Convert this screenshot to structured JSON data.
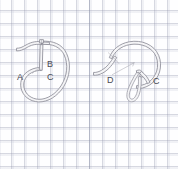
{
  "figure": {
    "type": "stitch-diagram",
    "background": "graph-paper",
    "grid": {
      "cell_px": 13,
      "line_color": "#9a9fb0",
      "paper_color": "#fdfdfd"
    },
    "thread": {
      "stroke_color": "#8a8a92",
      "fill_color": "#f2f2f4",
      "style": "double-outline"
    },
    "panels": [
      {
        "id": "panel-left",
        "name": "left-stitch-step",
        "labels": [
          {
            "id": "label-a",
            "text": "A",
            "x": 17,
            "y": 73
          },
          {
            "id": "label-b",
            "text": "B",
            "x": 47,
            "y": 60
          },
          {
            "id": "label-c",
            "text": "C",
            "x": 47,
            "y": 73
          }
        ]
      },
      {
        "id": "panel-right",
        "name": "right-stitch-step",
        "labels": [
          {
            "id": "label-d",
            "text": "D",
            "x": 107,
            "y": 76
          },
          {
            "id": "label-c2",
            "text": "C",
            "x": 153,
            "y": 77
          }
        ]
      }
    ]
  }
}
